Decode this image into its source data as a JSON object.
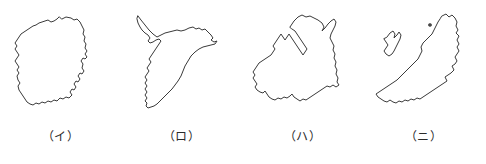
{
  "figure": {
    "name": "japanese-prefecture-outline-quiz",
    "width": 486,
    "height": 164,
    "background_color": "#ffffff",
    "outline_color": "#3a3a3a",
    "label_color": "#2b2b2b"
  },
  "panels": [
    {
      "label": "（イ）",
      "shape_name": "tochigi-prefecture-outline",
      "islets": []
    },
    {
      "label": "（ロ）",
      "shape_name": "chiba-prefecture-outline",
      "islets": []
    },
    {
      "label": "（ハ）",
      "shape_name": "aomori-prefecture-outline",
      "islets": []
    },
    {
      "label": "（ニ）",
      "shape_name": "niigata-prefecture-outline",
      "islets": [
        "sado-island-outline",
        "awashima-islet-dot"
      ]
    }
  ]
}
